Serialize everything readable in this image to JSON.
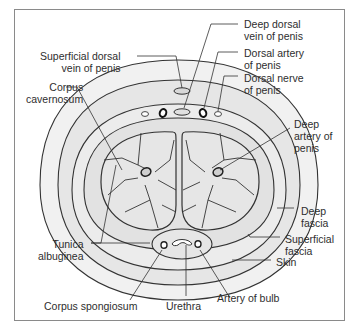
{
  "diagram": {
    "colors": {
      "outline": "#333333",
      "skin_fill": "#f1f1f1",
      "fascia_fill": "#e4e4e4",
      "tissue_fill": "#dcdcdc",
      "vessel_fill": "#e9e9e9",
      "label": "#2e2e2e",
      "frame": "#8a8a8a"
    },
    "labels": {
      "superficial_dorsal_vein": "Superficial dorsal\n   vein of penis",
      "corpus_cavernosum": "   Corpus\ncavernosum",
      "deep_dorsal_vein": "Deep dorsal\nvein of penis",
      "dorsal_artery": "Dorsal artery\nof penis",
      "dorsal_nerve": "Dorsal nerve\nof penis",
      "deep_artery": "Deep\nartery of\npenis",
      "deep_fascia": "Deep\nfascia",
      "superficial_fascia": "Superficial\nfascia",
      "skin": "Skin",
      "tunica_albuginea": "  Tunica\nalbuginea",
      "corpus_spongiosum": "Corpus spongiosum",
      "urethra": "Urethra",
      "artery_of_bulb": "Artery of bulb"
    }
  }
}
